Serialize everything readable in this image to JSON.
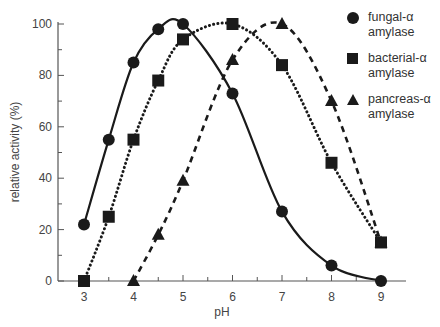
{
  "chart_data": {
    "type": "line",
    "title": "",
    "xlabel": "pH",
    "ylabel": "relative activity (%)",
    "xlim": [
      2.6,
      9.5
    ],
    "ylim": [
      0,
      100
    ],
    "xticks": [
      3,
      4,
      5,
      6,
      7,
      8,
      9
    ],
    "yticks": [
      0,
      20,
      40,
      60,
      80,
      100
    ],
    "grid": false,
    "legend_position": "upper right (outside plot area)",
    "series": [
      {
        "name": "fungal-α amylase",
        "marker": "circle",
        "line_style": "solid",
        "x": [
          3,
          3.5,
          4,
          4.5,
          5,
          6,
          7,
          8,
          9
        ],
        "values": [
          22,
          55,
          85,
          98,
          100,
          73,
          27,
          6,
          0
        ]
      },
      {
        "name": "bacterial-α amylase",
        "marker": "square",
        "line_style": "dotted",
        "x": [
          3,
          3.5,
          4,
          4.5,
          5,
          6,
          7,
          8,
          9
        ],
        "values": [
          0,
          25,
          55,
          78,
          94,
          100,
          84,
          46,
          15
        ]
      },
      {
        "name": "pancreas-α amylase",
        "marker": "triangle",
        "line_style": "dashed",
        "x": [
          4,
          4.5,
          5,
          6,
          7,
          8,
          9
        ],
        "values": [
          0,
          18,
          39,
          86,
          100,
          70,
          15
        ]
      }
    ]
  },
  "axes": {
    "x_tick_labels": [
      "3",
      "4",
      "5",
      "6",
      "7",
      "8",
      "9"
    ],
    "y_tick_labels": [
      "0",
      "20",
      "40",
      "60",
      "80",
      "100"
    ],
    "xlabel": "pH",
    "ylabel": "relative activity (%)"
  },
  "legend": {
    "items": [
      {
        "line1": "fungal-α",
        "line2": "amylase",
        "marker": "circle"
      },
      {
        "line1": "bacterial-α",
        "line2": "amylase",
        "marker": "square"
      },
      {
        "line1": "pancreas-α",
        "line2": "amylase",
        "marker": "triangle"
      }
    ]
  }
}
